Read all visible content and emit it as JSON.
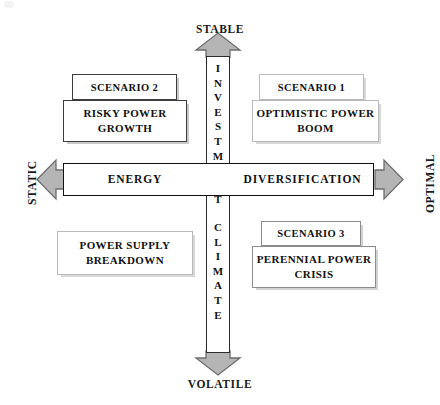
{
  "diagram": {
    "background_color": "#ffffff",
    "arrow_fill_color": "#b5b5b5",
    "arrow_stroke_color": "#6e6e6e"
  },
  "axes": {
    "vertical": {
      "label_text": "INVESTMENT CLIMATE",
      "label_top": "STABLE",
      "label_bottom": "VOLATILE",
      "letters_line1": [
        "I",
        "N",
        "V",
        "E",
        "S",
        "T",
        "M",
        "E",
        "N",
        "T"
      ],
      "letters_line2": [
        "C",
        "L",
        "I",
        "M",
        "A",
        "T",
        "E"
      ],
      "arrow_up_icon": "arrow-up-icon",
      "arrow_down_icon": "arrow-down-icon"
    },
    "horizontal": {
      "label_left_end": "STATIC",
      "label_right_end": "OPTIMAL",
      "segment_left": "ENERGY",
      "segment_right": "DIVERSIFICATION",
      "arrow_left_icon": "arrow-left-icon",
      "arrow_right_icon": "arrow-right-icon"
    }
  },
  "quadrants": [
    {
      "id": "scenario-2",
      "position": "top-left",
      "tab_label": "SCENARIO 2",
      "body_label": "RISKY POWER GROWTH",
      "has_tab": true
    },
    {
      "id": "scenario-1",
      "position": "top-right",
      "tab_label": "SCENARIO 1",
      "body_label": "OPTIMISTIC POWER BOOM",
      "has_tab": true
    },
    {
      "id": "power-supply-breakdown",
      "position": "bottom-left",
      "tab_label": "",
      "body_label": "POWER SUPPLY BREAKDOWN",
      "has_tab": false
    },
    {
      "id": "scenario-3",
      "position": "bottom-right",
      "tab_label": "SCENARIO 3",
      "body_label": "PERENNIAL POWER CRISIS",
      "has_tab": true
    }
  ]
}
